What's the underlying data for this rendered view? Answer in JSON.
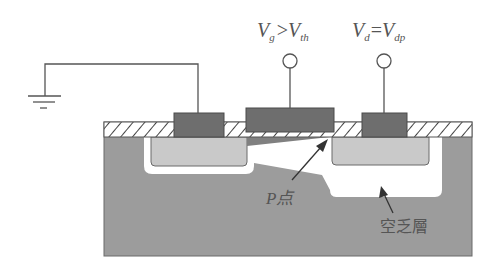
{
  "diagram": {
    "type": "MOSFET cross-section at pinch-off",
    "labels": {
      "gate_voltage": {
        "main": "V",
        "sub1": "g",
        "op": ">",
        "main2": "V",
        "sub2": "th"
      },
      "drain_voltage": {
        "main": "V",
        "sub1": "d",
        "op": "=",
        "main2": "V",
        "sub2": "dp"
      },
      "p_point": "P点",
      "depletion_layer": "空乏層"
    },
    "terminals": [
      {
        "name": "source",
        "connection": "ground"
      },
      {
        "name": "gate",
        "connection": "terminal"
      },
      {
        "name": "drain",
        "connection": "terminal"
      }
    ],
    "colors": {
      "substrate": "#9c9c9c",
      "contact": "#6e6e6e",
      "diffusion": "#c9c9c9",
      "depletion": "#ffffff",
      "channel": "#808080",
      "line": "#555555",
      "oxide_hatch": "#444444"
    }
  }
}
